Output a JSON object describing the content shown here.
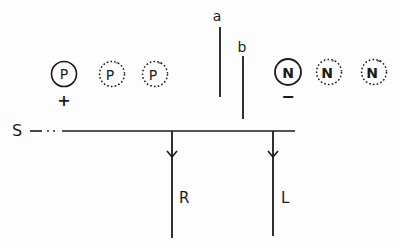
{
  "diagram": {
    "stroke_color": "#1a1a1a",
    "background": "#fdfdfd",
    "source_label": "S",
    "vertical_markers": [
      {
        "label": "a",
        "x": 220,
        "y_top": 27,
        "y_bottom": 97
      },
      {
        "label": "b",
        "x": 243,
        "y_top": 56,
        "y_bottom": 119
      }
    ],
    "positive_group": {
      "sign": "+",
      "nodes": [
        {
          "label": "P",
          "superscript": "",
          "style": "solid"
        },
        {
          "label": "P",
          "superscript": "′",
          "style": "dotted"
        },
        {
          "label": "P",
          "superscript": "″",
          "style": "dotted"
        }
      ]
    },
    "negative_group": {
      "sign": "−",
      "nodes": [
        {
          "label": "N",
          "superscript": "",
          "style": "solid"
        },
        {
          "label": "N",
          "superscript": "′",
          "style": "dotted"
        },
        {
          "label": "N",
          "superscript": "″",
          "style": "dotted"
        }
      ]
    },
    "branches": [
      {
        "label": "R",
        "x": 172
      },
      {
        "label": "L",
        "x": 273
      }
    ]
  }
}
